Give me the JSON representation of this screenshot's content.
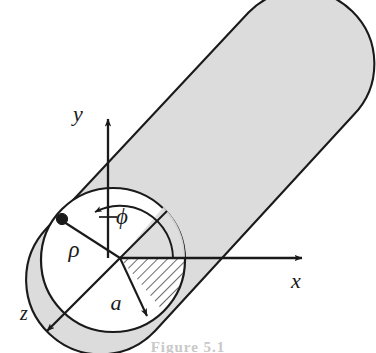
{
  "figure": {
    "caption_partial": "Figure 5.1",
    "colors": {
      "cylinder_fill": "#dcdcdc",
      "outline": "#1a1a1a",
      "background": "#ffffff",
      "hatch": "#1a1a1a"
    },
    "axes": [
      {
        "id": "y",
        "label": "y",
        "label_x": 78,
        "label_y": 121,
        "direction": "up"
      },
      {
        "id": "x",
        "label": "x",
        "label_x": 296,
        "label_y": 288,
        "direction": "right"
      },
      {
        "id": "z",
        "label": "z",
        "label_x": 24,
        "label_y": 320,
        "direction": "down-left"
      }
    ],
    "annotations": [
      {
        "id": "phi",
        "label": "ϕ",
        "label_x": 122,
        "label_y": 224,
        "meaning": "azimuthal-angle"
      },
      {
        "id": "rho",
        "label": "ρ",
        "label_x": 74,
        "label_y": 257,
        "meaning": "radial-distance"
      },
      {
        "id": "a",
        "label": "a",
        "label_x": 116,
        "label_y": 310,
        "meaning": "cylinder-radius"
      }
    ],
    "geometry": {
      "origin": {
        "x": 120,
        "y": 258
      },
      "circle": {
        "cx": 113,
        "cy": 260,
        "r": 72
      },
      "point_marker": {
        "x": 62,
        "y": 220,
        "r": 5.5
      },
      "cylinder_axis_angle_deg": -43,
      "cylinder_far_end_center": {
        "x": 316,
        "y": 92
      }
    }
  }
}
